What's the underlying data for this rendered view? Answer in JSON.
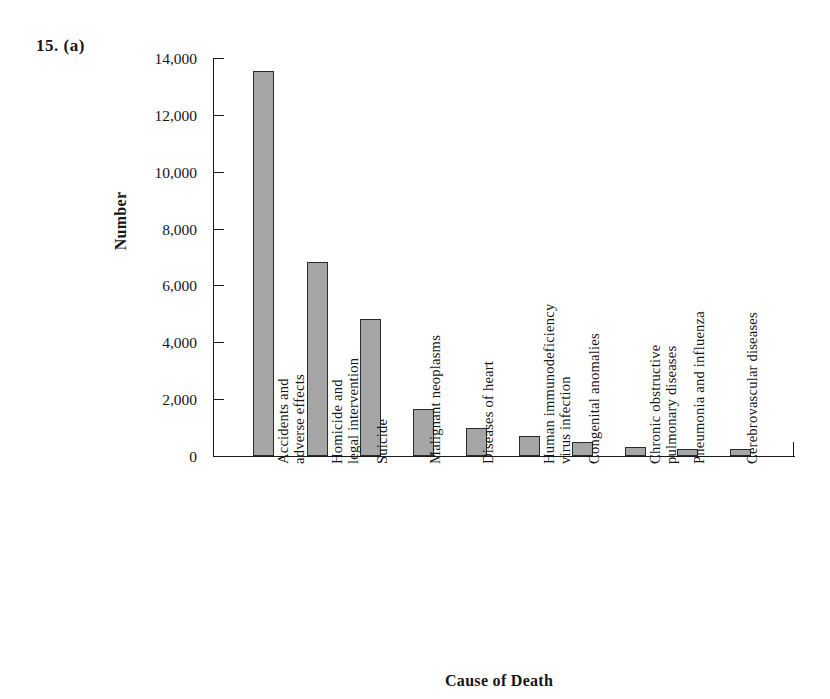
{
  "problem": {
    "number": "15.  (a)"
  },
  "chart_data": {
    "type": "bar",
    "title": "",
    "xlabel": "Cause of Death",
    "ylabel": "Number",
    "ylim": [
      0,
      14000
    ],
    "ytick_step": 2000,
    "grid": false,
    "legend": null,
    "bar_fill_color": "#a6a6a6",
    "bar_border_color": "#2b2b2b",
    "ytick_labels": [
      "14,000",
      "12,000",
      "10,000",
      "8,000",
      "6,000",
      "4,000",
      "2,000",
      "0"
    ],
    "ytick_values": [
      14000,
      12000,
      10000,
      8000,
      6000,
      4000,
      2000,
      0
    ],
    "categories": [
      "Accidents and adverse effects",
      "Homicide and legal intervention",
      "Suicide",
      "Malignant neoplasms",
      "Diseases of heart",
      "Human immunodeficiency virus infection",
      "Congenital anomalies",
      "Chronic obstructive pulmonary diseases",
      "Pneumonia and influenza",
      "Cerebrovascular diseases",
      "All other causes"
    ],
    "category_lines": [
      [
        "Accidents and",
        "adverse effects"
      ],
      [
        "Homicide and",
        "legal intervention"
      ],
      [
        "Suicide",
        ""
      ],
      [
        "Malignant neoplasms",
        ""
      ],
      [
        "Diseases of heart",
        ""
      ],
      [
        "Human immunodeficiency",
        "virus infection"
      ],
      [
        "Congenital anomalies",
        ""
      ],
      [
        "Chronic obstructive",
        "pulmonary diseases"
      ],
      [
        "Pneumonia and influenza",
        ""
      ],
      [
        "Cerebrovascular diseases",
        ""
      ],
      [
        "All other causes",
        ""
      ]
    ],
    "values": [
      13550,
      6820,
      4820,
      1650,
      1000,
      700,
      500,
      300,
      260,
      240,
      4250
    ]
  }
}
